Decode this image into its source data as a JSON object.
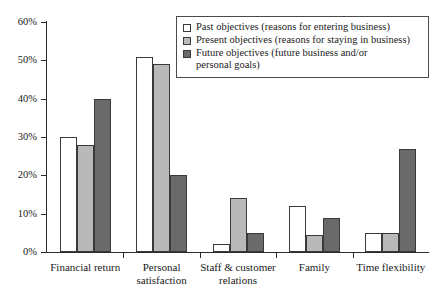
{
  "chart_data": {
    "type": "bar",
    "title": "",
    "subtitle": "",
    "xlabel": "",
    "ylabel": "",
    "ylim": [
      0,
      60
    ],
    "ytick_labels": [
      "0%",
      "10%",
      "20%",
      "30%",
      "40%",
      "50%",
      "60%"
    ],
    "ytick_values": [
      0,
      10,
      20,
      30,
      40,
      50,
      60
    ],
    "grid": false,
    "legend_position": "upper-right",
    "categories": [
      "Financial return",
      "Personal\nsatisfaction",
      "Staff & customer\nrelations",
      "Family",
      "Time flexibility"
    ],
    "series": [
      {
        "name": "Past objectives (reasons for entering business)",
        "key": "past",
        "color": "#ffffff",
        "values": [
          30,
          51,
          2,
          12,
          5
        ]
      },
      {
        "name": "Present objectives (reasons for staying in business)",
        "key": "present",
        "color": "#b9b9b9",
        "values": [
          28,
          49,
          14,
          4.5,
          5
        ]
      },
      {
        "name": "Future objectives (future business and/or\npersonal goals)",
        "key": "future",
        "color": "#6a6a6a",
        "values": [
          40,
          20,
          5,
          9,
          27
        ]
      }
    ]
  },
  "legend": {
    "items": [
      {
        "label": "Past objectives (reasons for entering business)",
        "swatch": "past"
      },
      {
        "label": "Present objectives (reasons for staying in business)",
        "swatch": "present"
      },
      {
        "label": "Future objectives (future business and/or\npersonal goals)",
        "swatch": "future"
      }
    ]
  }
}
